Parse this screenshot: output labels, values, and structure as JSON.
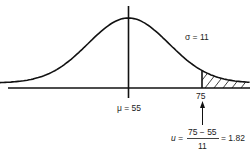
{
  "diagram": {
    "type": "normal-distribution",
    "mean_label": "μ = 55",
    "mean_value": 55,
    "sigma_label": "σ = 11",
    "sigma_value": 11,
    "cutoff_label": "75",
    "cutoff_value": 75,
    "formula": {
      "lhs": "u =",
      "numerator": "75 − 55",
      "denominator": "11",
      "rhs": "= 1.82"
    },
    "shaded_region": "right tail above 75"
  }
}
